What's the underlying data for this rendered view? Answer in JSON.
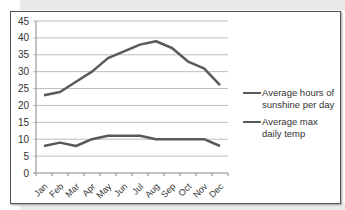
{
  "chart_data": {
    "type": "line",
    "title": "",
    "xlabel": "",
    "ylabel": "",
    "categories": [
      "Jan",
      "Feb",
      "Mar",
      "Apr",
      "May",
      "Jun",
      "Jul",
      "Aug",
      "Sep",
      "Oct",
      "Nov",
      "Dec"
    ],
    "series": [
      {
        "name": "Average hours of sunshine per day",
        "values": [
          23,
          24,
          27,
          30,
          34,
          36,
          38,
          39,
          37,
          33,
          31,
          26
        ],
        "color": "#5a5a5a"
      },
      {
        "name": "Average max daily temp",
        "values": [
          8,
          9,
          8,
          10,
          11,
          11,
          11,
          10,
          10,
          10,
          10,
          8
        ],
        "color": "#5a5a5a"
      }
    ],
    "ylim": [
      0,
      45
    ],
    "yticks": [
      0,
      5,
      10,
      15,
      20,
      25,
      30,
      35,
      40,
      45
    ],
    "grid": true,
    "legend_position": "right"
  },
  "legend": {
    "items": [
      {
        "label": "Average hours of sunshine per day"
      },
      {
        "label": "Average max daily temp"
      }
    ]
  }
}
